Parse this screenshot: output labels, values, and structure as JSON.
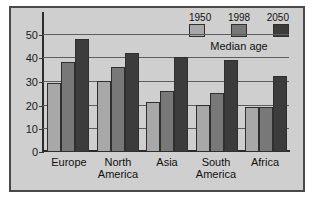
{
  "chart_data": {
    "type": "bar",
    "title": "",
    "subtitle": "",
    "xlabel": "",
    "ylabel": "",
    "legend_title": "Median age",
    "legend_position": "top-right",
    "grid": true,
    "ylim": [
      0,
      55
    ],
    "yticks": [
      0,
      10,
      20,
      30,
      40,
      50
    ],
    "ytick_labels": [
      "0",
      "10",
      "20",
      "30",
      "40",
      "50"
    ],
    "categories": [
      "Europe",
      "North America",
      "Asia",
      "South America",
      "Africa"
    ],
    "category_lines": [
      [
        "Europe"
      ],
      [
        "North",
        "America"
      ],
      [
        "Asia"
      ],
      [
        "South",
        "America"
      ],
      [
        "Africa"
      ]
    ],
    "series": [
      {
        "name": "1950",
        "color": "#a8a8a8",
        "values": [
          29,
          30,
          21,
          20,
          19
        ]
      },
      {
        "name": "1998",
        "color": "#787878",
        "values": [
          38,
          36,
          26,
          25,
          19
        ]
      },
      {
        "name": "2050",
        "color": "#3c3c3c",
        "values": [
          48,
          42,
          40,
          39,
          32
        ]
      }
    ]
  },
  "figure": {
    "background_color": "#cfcfcf",
    "border_color": "#4a4a4a",
    "axis_color": "#2b2b2b",
    "grid_color": "#5d5d5d"
  }
}
